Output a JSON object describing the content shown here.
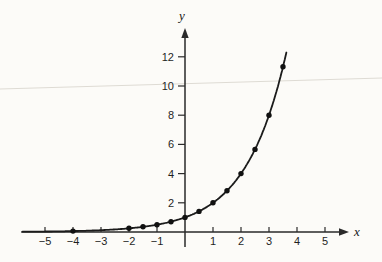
{
  "figure": {
    "background_color": "#fcfbf8"
  },
  "chart_data": {
    "type": "line",
    "function": "y = 2^x",
    "title": "",
    "xlabel": "x",
    "ylabel": "y",
    "series": [
      {
        "name": "plotted-points",
        "points": [
          {
            "x": -4,
            "y": 0.0625
          },
          {
            "x": -2,
            "y": 0.25
          },
          {
            "x": -1.5,
            "y": 0.3536
          },
          {
            "x": -1,
            "y": 0.5
          },
          {
            "x": -0.5,
            "y": 0.7071
          },
          {
            "x": 0,
            "y": 1
          },
          {
            "x": 0.5,
            "y": 1.4142
          },
          {
            "x": 1,
            "y": 2
          },
          {
            "x": 1.5,
            "y": 2.8284
          },
          {
            "x": 2,
            "y": 4
          },
          {
            "x": 2.5,
            "y": 5.6569
          },
          {
            "x": 3,
            "y": 8
          },
          {
            "x": 3.5,
            "y": 11.3137
          }
        ]
      }
    ],
    "x_ticks": [
      -5,
      -4,
      -3,
      -2,
      -1,
      1,
      2,
      3,
      4,
      5
    ],
    "y_ticks": [
      2,
      4,
      6,
      8,
      10,
      12
    ],
    "xlim": [
      -5.85,
      5.7
    ],
    "ylim": [
      0,
      13.9
    ],
    "curve_domain": [
      -5.8,
      3.63
    ],
    "grid": false,
    "legend": false,
    "colors": {
      "curve": "#1b1b1b",
      "axis": "#2a2a2a",
      "point": "#111111",
      "tick_label": "#1f1f1f",
      "artifact_line": "#dedbd4"
    }
  }
}
